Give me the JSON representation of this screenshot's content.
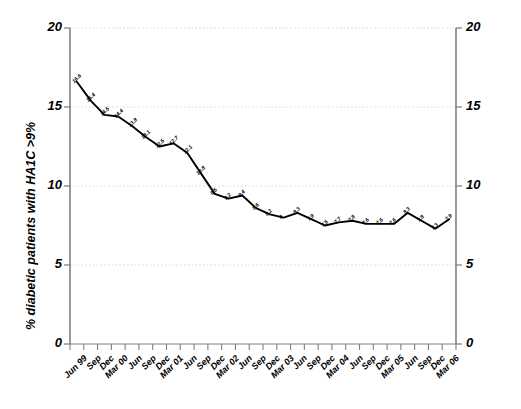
{
  "chart_data": {
    "type": "line",
    "title": "",
    "xlabel": "",
    "ylabel": "% diabetic patients with HA1C >9%",
    "ylim": [
      0,
      20
    ],
    "yticks": [
      0,
      5,
      10,
      15,
      20
    ],
    "yticks_right": [
      0,
      5,
      10,
      15,
      20
    ],
    "grid": true,
    "grid_style": "dotted",
    "legend": "none",
    "marker": "none",
    "line_color": "#000000",
    "grid_color": "#d9d9d9",
    "axis_color": "#808080",
    "categories": [
      "Jun 99",
      "Sep",
      "Dec",
      "Mar 00",
      "Jun",
      "Sep",
      "Dec",
      "Mar 01",
      "Jun",
      "Sep",
      "Dec",
      "Mar 02",
      "Jun",
      "Sep",
      "Dec",
      "Mar 03",
      "Jun",
      "Sep",
      "Dec",
      "Mar 04",
      "Jun",
      "Sep",
      "Dec",
      "Mar 05",
      "Jun",
      "Sep",
      "Dec",
      "Mar 06"
    ],
    "values": [
      16.6,
      15.4,
      14.5,
      14.4,
      13.8,
      13.1,
      12.5,
      12.7,
      12.1,
      10.8,
      9.5,
      9.2,
      9.4,
      8.6,
      8.2,
      8,
      8.3,
      7.9,
      7.5,
      7.7,
      7.8,
      7.6,
      7.6,
      7.6,
      8.3,
      7.8,
      7.3,
      7.9
    ],
    "point_labels": [
      "16.6",
      "15.4",
      "14.5",
      "14.4",
      "13.8",
      "13.1",
      "12.5",
      "12.7",
      "12.1",
      "10.8",
      "9.5",
      "9.2",
      "9.4",
      "8.6",
      "8.2",
      "8",
      "8.3",
      "7.9",
      "7.5",
      "7.7",
      "7.8",
      "7.6",
      "7.6",
      "7.6",
      "8.3",
      "7.8",
      "7.3",
      "7.9"
    ]
  }
}
